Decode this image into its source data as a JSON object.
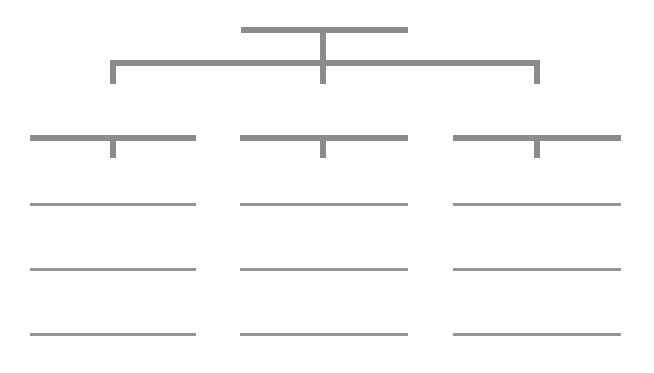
{
  "diagram": {
    "type": "org-chart",
    "line_color": "#8c8c8c",
    "root": {
      "label": ""
    },
    "branches": [
      {
        "label": "",
        "items": [
          "",
          "",
          ""
        ]
      },
      {
        "label": "",
        "items": [
          "",
          "",
          ""
        ]
      },
      {
        "label": "",
        "items": [
          "",
          "",
          ""
        ]
      }
    ]
  }
}
